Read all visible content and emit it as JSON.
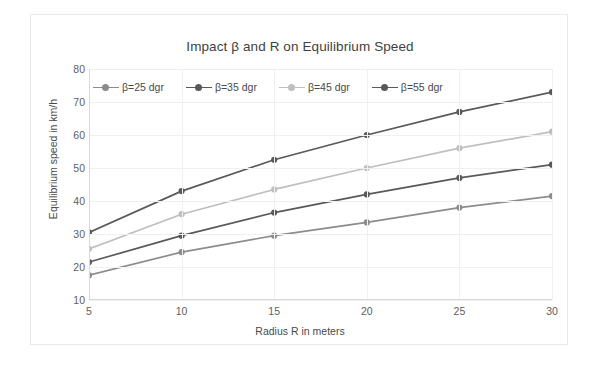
{
  "chart_data": {
    "type": "line",
    "title": "Impact β and R on Equilibrium Speed",
    "xlabel": "Radius R in meters",
    "ylabel": "Equilibrium speed in km/h",
    "x": [
      5,
      10,
      15,
      20,
      25,
      30
    ],
    "xtick_labels": [
      "5",
      "10",
      "15",
      "20",
      "25",
      "30"
    ],
    "ytick_labels": [
      "10",
      "20",
      "30",
      "40",
      "50",
      "60",
      "70",
      "80"
    ],
    "yticks": [
      10,
      20,
      30,
      40,
      50,
      60,
      70,
      80
    ],
    "xlim": [
      5,
      30
    ],
    "ylim": [
      10,
      80
    ],
    "grid": "both-light",
    "legend_position": "top-left-inside",
    "series": [
      {
        "name": "β=25 dgr",
        "color": "#8c8c8c",
        "values": [
          17.5,
          24.5,
          29.5,
          33.5,
          38.0,
          41.5
        ]
      },
      {
        "name": "β=35 dgr",
        "color": "#595959",
        "values": [
          21.5,
          29.5,
          36.5,
          42.0,
          47.0,
          51.0
        ]
      },
      {
        "name": "β=45 dgr",
        "color": "#bfbfbf",
        "values": [
          25.5,
          36.0,
          43.5,
          50.0,
          56.0,
          61.0
        ]
      },
      {
        "name": "β=55 dgr",
        "color": "#595959",
        "values": [
          30.5,
          43.0,
          52.5,
          60.0,
          67.0,
          73.0
        ]
      }
    ]
  },
  "figure": {
    "background": "#ffffff",
    "frame_color": "#e9e9e9",
    "grid_color": "#f0f0f0",
    "axis_color": "#d9d9d9",
    "text_color": "#4a4a4a"
  }
}
